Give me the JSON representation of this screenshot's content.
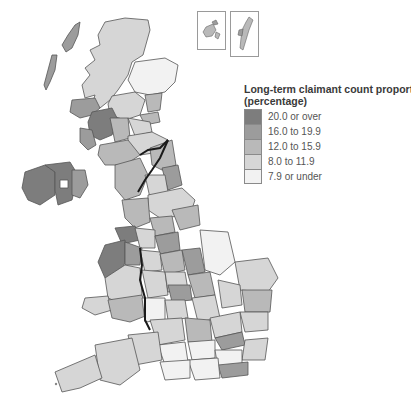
{
  "legend": {
    "title": "Long-term claimant count proportion",
    "footnote_marker": "1",
    "subtitle": "(percentage)",
    "items": [
      {
        "label": "20.0 or over",
        "color": "#7d7d7d"
      },
      {
        "label": "16.0 to 19.9",
        "color": "#9c9c9c"
      },
      {
        "label": "12.0 to 15.9",
        "color": "#b9b9b9"
      },
      {
        "label": "8.0 to 11.9",
        "color": "#d6d6d6"
      },
      {
        "label": "7.9 or under",
        "color": "#f2f2f2"
      }
    ]
  },
  "insets": [
    {
      "name": "Orkney Islands"
    },
    {
      "name": "Shetland Islands"
    }
  ],
  "colors": {
    "border": "#555555",
    "national_border": "#1a1a1a",
    "background": "#ffffff"
  }
}
